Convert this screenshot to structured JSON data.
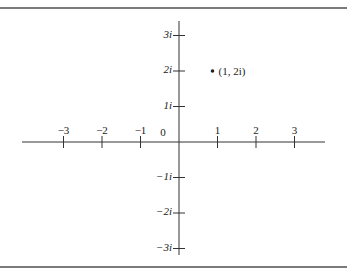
{
  "diagram": {
    "type": "complex-plane",
    "real_axis_ticks": [
      {
        "value": -3,
        "label": "−3"
      },
      {
        "value": -2,
        "label": "−2"
      },
      {
        "value": -1,
        "label": "−1"
      },
      {
        "value": 1,
        "label": "1"
      },
      {
        "value": 2,
        "label": "2"
      },
      {
        "value": 3,
        "label": "3"
      }
    ],
    "origin_label": "0",
    "imag_axis_ticks": [
      {
        "value": 3,
        "label": "3i"
      },
      {
        "value": 2,
        "label": "2i"
      },
      {
        "value": 1,
        "label": "1i"
      },
      {
        "value": -1,
        "label": "−1i"
      },
      {
        "value": -2,
        "label": "−2i"
      },
      {
        "value": -3,
        "label": "−3i"
      }
    ],
    "points": [
      {
        "x": 1,
        "y": 2,
        "label": "(1, 2i)"
      }
    ],
    "colors": {
      "axis": "#333333",
      "frame": "#7a7a7a",
      "text": "#222222"
    }
  }
}
